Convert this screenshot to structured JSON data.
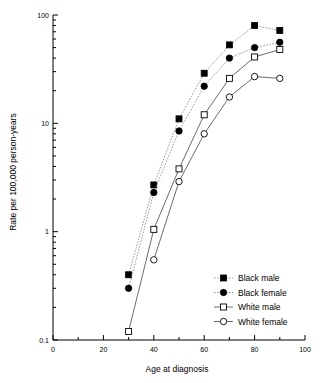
{
  "chart_data": {
    "type": "line",
    "title": "",
    "xlabel": "Age at diagnosis",
    "ylabel": "Rate per 100,000 person-years",
    "xlim": [
      0,
      100
    ],
    "ylim": [
      0.1,
      100
    ],
    "yscale": "log",
    "grid": false,
    "legend_position": "bottom-right",
    "x_ticks": [
      "0",
      "20",
      "40",
      "60",
      "80",
      "100"
    ],
    "x_tick_values": [
      0,
      20,
      40,
      60,
      80,
      100
    ],
    "x_minor_tick_values": [
      10,
      30,
      50,
      70,
      90
    ],
    "y_ticks": [
      "0.1",
      "1",
      "10",
      "100"
    ],
    "y_tick_values": [
      0.1,
      1,
      10,
      100
    ],
    "x": [
      30,
      40,
      50,
      60,
      70,
      80,
      90
    ],
    "series": [
      {
        "name": "Black male",
        "marker": "filled-square",
        "linestyle": "dotted",
        "x": [
          30,
          40,
          50,
          60,
          70,
          80,
          90
        ],
        "values": [
          0.4,
          2.7,
          11,
          29,
          53,
          80,
          72
        ]
      },
      {
        "name": "Black female",
        "marker": "filled-circle",
        "linestyle": "dotted",
        "x": [
          30,
          40,
          50,
          60,
          70,
          80,
          90
        ],
        "values": [
          0.3,
          2.3,
          8.5,
          22,
          40,
          50,
          56
        ]
      },
      {
        "name": "White male",
        "marker": "open-square",
        "linestyle": "solid",
        "x": [
          30,
          40,
          50,
          60,
          70,
          80,
          90
        ],
        "values": [
          0.12,
          1.05,
          3.8,
          12,
          26,
          41,
          48
        ]
      },
      {
        "name": "White female",
        "marker": "open-circle",
        "linestyle": "solid",
        "x": [
          40,
          50,
          60,
          70,
          80,
          90
        ],
        "values": [
          0.55,
          2.9,
          8,
          17.5,
          27,
          26
        ]
      }
    ],
    "legend": [
      {
        "label": "Black male",
        "marker": "filled-square",
        "linestyle": "dotted"
      },
      {
        "label": "Black female",
        "marker": "filled-circle",
        "linestyle": "dotted"
      },
      {
        "label": "White male",
        "marker": "open-square",
        "linestyle": "solid"
      },
      {
        "label": "White female",
        "marker": "open-circle",
        "linestyle": "solid"
      }
    ],
    "colors": {
      "axis": "#000000",
      "text": "#000000",
      "marker_filled": "#000000",
      "marker_open_fill": "#ffffff",
      "line_dotted": "#8c8c8c",
      "line_solid": "#5a5a5a",
      "background": "#ffffff"
    }
  }
}
